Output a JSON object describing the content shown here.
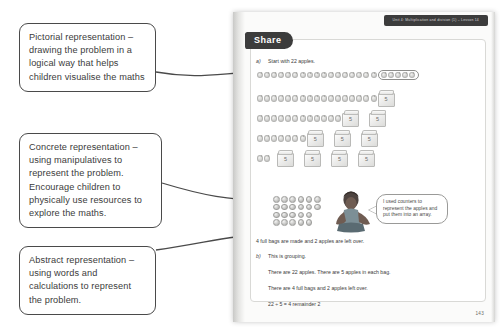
{
  "callouts": [
    {
      "id": "pictorial",
      "text": "Pictorial representation – drawing the problem in a logical way that helps children visualise the maths"
    },
    {
      "id": "concrete",
      "text": "Concrete representation – using manipulatives to represent the problem. Encourage children to physically use resources to explore the maths."
    },
    {
      "id": "abstract",
      "text": "Abstract representation – using words and calculations to represent the problem."
    }
  ],
  "page": {
    "unit_banner": "Unit 4: Multiplication and division (1) – Lesson 14",
    "section_label": "Share",
    "page_number": "143",
    "part_a": {
      "marker": "a)",
      "prompt": "Start with 22 apples.",
      "conclusion": "4 full bags are made and 2 apples are left over."
    },
    "part_b": {
      "marker": "b)",
      "lines": [
        "This is grouping.",
        "There are 22 apples. There are 5 apples in each bag.",
        "There are 4 full bags and 2 apples left over.",
        "22 ÷ 5 = 4 remainder 2"
      ]
    },
    "speech_bubble": "I used counters to represent the apples and put them into an array.",
    "bag_label": "5",
    "apple_rows": [
      {
        "apples": 17,
        "circled": 5,
        "bags": 0
      },
      {
        "apples": 17,
        "circled": 0,
        "bags": 1
      },
      {
        "apples": 12,
        "circled": 0,
        "bags": 2
      },
      {
        "apples": 7,
        "circled": 0,
        "bags": 3
      },
      {
        "apples": 2,
        "circled": 0,
        "bags": 4
      }
    ],
    "counter_array": [
      6,
      6,
      5,
      5
    ]
  },
  "colors": {
    "ink": "#3b3b3b",
    "banner": "#3c3c3c",
    "page": "#fbfbfa",
    "frame": "#d9d9d6"
  }
}
